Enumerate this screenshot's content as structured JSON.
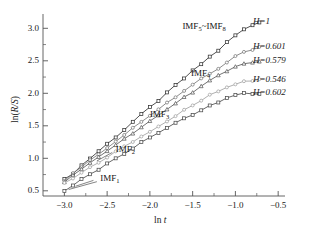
{
  "chart_data": {
    "type": "line",
    "title": "",
    "xlabel": "ln t",
    "ylabel": "ln(R/S)",
    "xlim": [
      -3.25,
      -0.42
    ],
    "ylim": [
      0.42,
      3.22
    ],
    "xticks": [
      "-3.0",
      "-2.5",
      "-2.0",
      "-1.5",
      "-1.0",
      "-0.5"
    ],
    "xtick_values": [
      -3.0,
      -2.5,
      -2.0,
      -1.5,
      -1.0,
      -0.5
    ],
    "yticks": [
      "0.5",
      "1.0",
      "1.5",
      "2.0",
      "2.5",
      "3.0"
    ],
    "ytick_values": [
      0.5,
      1.0,
      1.5,
      2.0,
      2.5,
      3.0
    ],
    "minor_ticks": true,
    "grid": false,
    "legend_position": "right-outside",
    "series": [
      {
        "name": "IMF5~IMF8",
        "legend": "H=1",
        "hurst": 1.0,
        "color": "#333333",
        "marker": "square",
        "x": [
          -3.0,
          -2.9,
          -2.8,
          -2.7,
          -2.6,
          -2.5,
          -2.4,
          -2.3,
          -2.2,
          -2.1,
          -2.0,
          -1.9,
          -1.8,
          -1.7,
          -1.6,
          -1.5,
          -1.4,
          -1.3,
          -1.2,
          -1.1,
          -1.0,
          -0.9,
          -0.8,
          -0.72
        ],
        "y": [
          0.67,
          0.77,
          0.89,
          1.0,
          1.11,
          1.22,
          1.33,
          1.44,
          1.56,
          1.67,
          1.78,
          1.89,
          2.0,
          2.12,
          2.23,
          2.34,
          2.45,
          2.56,
          2.66,
          2.78,
          2.89,
          2.98,
          3.05,
          3.1
        ]
      },
      {
        "name": "IMF4",
        "legend": "H=0.601",
        "hurst": 0.601,
        "color": "#777777",
        "marker": "circle",
        "x": [
          -3.0,
          -2.9,
          -2.8,
          -2.7,
          -2.6,
          -2.5,
          -2.4,
          -2.3,
          -2.2,
          -2.1,
          -2.0,
          -1.9,
          -1.8,
          -1.7,
          -1.6,
          -1.5,
          -1.4,
          -1.3,
          -1.2,
          -1.1,
          -1.0,
          -0.9,
          -0.8,
          -0.72
        ],
        "y": [
          0.66,
          0.76,
          0.86,
          0.96,
          1.06,
          1.16,
          1.26,
          1.36,
          1.46,
          1.56,
          1.66,
          1.76,
          1.85,
          1.94,
          2.03,
          2.12,
          2.22,
          2.3,
          2.39,
          2.48,
          2.57,
          2.64,
          2.68,
          2.71
        ]
      },
      {
        "name": "IMF3",
        "legend": "H=0.579",
        "hurst": 0.579,
        "color": "#595959",
        "marker": "triangle",
        "x": [
          -3.0,
          -2.9,
          -2.8,
          -2.7,
          -2.6,
          -2.5,
          -2.4,
          -2.3,
          -2.2,
          -2.1,
          -2.0,
          -1.9,
          -1.8,
          -1.7,
          -1.6,
          -1.5,
          -1.4,
          -1.3,
          -1.2,
          -1.1,
          -1.0,
          -0.9,
          -0.8,
          -0.72
        ],
        "y": [
          0.64,
          0.73,
          0.82,
          0.92,
          1.01,
          1.1,
          1.2,
          1.29,
          1.38,
          1.47,
          1.57,
          1.66,
          1.75,
          1.84,
          1.93,
          2.02,
          2.11,
          2.2,
          2.28,
          2.34,
          2.4,
          2.45,
          2.48,
          2.5
        ]
      },
      {
        "name": "IMF2",
        "legend": "H=0.546",
        "hurst": 0.546,
        "color": "#a0a0a0",
        "marker": "circle",
        "x": [
          -3.0,
          -2.9,
          -2.8,
          -2.7,
          -2.6,
          -2.5,
          -2.4,
          -2.3,
          -2.2,
          -2.1,
          -2.0,
          -1.9,
          -1.8,
          -1.7,
          -1.6,
          -1.5,
          -1.4,
          -1.3,
          -1.2,
          -1.1,
          -1.0,
          -0.9,
          -0.8,
          -0.72
        ],
        "y": [
          0.62,
          0.7,
          0.78,
          0.86,
          0.94,
          1.02,
          1.1,
          1.18,
          1.26,
          1.34,
          1.42,
          1.5,
          1.58,
          1.66,
          1.74,
          1.82,
          1.9,
          1.97,
          2.03,
          2.09,
          2.14,
          2.18,
          2.2,
          2.21
        ]
      },
      {
        "name": "IMF1",
        "legend": "H=0.602",
        "hurst": 0.602,
        "color": "#4d4d4d",
        "marker": "square",
        "x": [
          -3.0,
          -2.9,
          -2.8,
          -2.7,
          -2.6,
          -2.5,
          -2.4,
          -2.3,
          -2.2,
          -2.1,
          -2.0,
          -1.9,
          -1.8,
          -1.7,
          -1.6,
          -1.5,
          -1.4,
          -1.3,
          -1.2,
          -1.1,
          -1.0,
          -0.9,
          -0.8,
          -0.72
        ],
        "y": [
          0.5,
          0.59,
          0.67,
          0.75,
          0.83,
          0.91,
          1.0,
          1.08,
          1.16,
          1.24,
          1.32,
          1.4,
          1.47,
          1.54,
          1.61,
          1.68,
          1.75,
          1.81,
          1.87,
          1.92,
          1.96,
          1.99,
          2.0,
          2.0
        ]
      }
    ],
    "legend_entries": [
      "H=1",
      "H=0.601",
      "H=0.579",
      "H=0.546",
      "H=0.602"
    ],
    "annotations": [
      {
        "id": "imf58",
        "text_main": "IMF",
        "sub1": "5",
        "mid": "~IMF",
        "sub2": "8",
        "x": -1.62,
        "y": 3.02
      },
      {
        "id": "imf4",
        "text_main": "IMF",
        "sub1": "4",
        "x": -1.52,
        "y": 2.3
      },
      {
        "id": "imf3",
        "text_main": "IMF",
        "sub1": "3",
        "x": -2.0,
        "y": 1.67
      },
      {
        "id": "imf2",
        "text_main": "IMF",
        "sub1": "2",
        "x": -2.4,
        "y": 1.13
      },
      {
        "id": "imf1",
        "text_main": "IMF",
        "sub1": "1",
        "x": -2.58,
        "y": 0.68
      }
    ]
  },
  "axes": {
    "ylabel_main": "ln(",
    "ylabel_italic": "R/S",
    "ylabel_close": ")",
    "xlabel_main": "ln ",
    "xlabel_italic": "t"
  },
  "colors": {
    "background": "#ffffff",
    "axis": "#555555",
    "text": "#1a1a1a"
  }
}
